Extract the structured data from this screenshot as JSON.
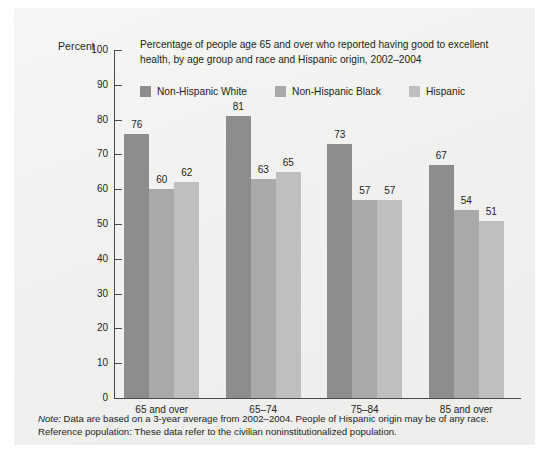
{
  "figure": {
    "y_axis_title": "Percent",
    "title": "Percentage of people age 65 and over who reported having good to excellent health, by age group and race and Hispanic origin, 2002–2004",
    "note_label": "Note:",
    "note_text": " Data are based on a 3-year average from 2002–2004. People of Hispanic origin may be of any race. Reference population: These data refer to the civilian noninstitutionalized population."
  },
  "chart_data": {
    "type": "bar",
    "title": "Percentage of people age 65 and over who reported having good to excellent health, by age group and race and Hispanic origin, 2002–2004",
    "xlabel": "",
    "ylabel": "Percent",
    "ylim": [
      0,
      100
    ],
    "yticks": [
      0,
      10,
      20,
      30,
      40,
      50,
      60,
      70,
      80,
      90,
      100
    ],
    "ytick_labels": [
      "0",
      "10",
      "20",
      "30",
      "40",
      "50",
      "60",
      "70",
      "80",
      "90",
      "100"
    ],
    "grid": false,
    "legend_position": "top-inside",
    "categories": [
      "65 and over",
      "65–74",
      "75–84",
      "85 and over"
    ],
    "series": [
      {
        "name": "Non-Hispanic White",
        "color": "#8d8d8d",
        "values": [
          76,
          81,
          73,
          67
        ]
      },
      {
        "name": "Non-Hispanic Black",
        "color": "#a9a9a9",
        "values": [
          60,
          63,
          57,
          54
        ]
      },
      {
        "name": "Hispanic",
        "color": "#bfbfbf",
        "values": [
          62,
          65,
          57,
          51
        ]
      }
    ]
  }
}
